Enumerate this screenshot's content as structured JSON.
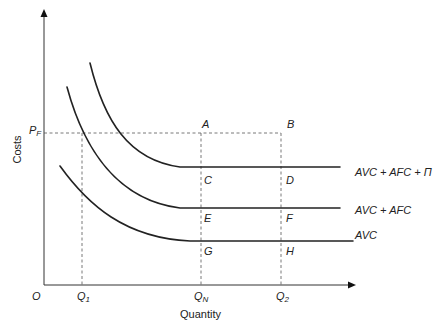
{
  "diagram": {
    "axes": {
      "y_title": "Costs",
      "x_title": "Quantity",
      "origin_label": "O"
    },
    "y_ticks": [
      {
        "main": "P",
        "sub": "F"
      }
    ],
    "x_ticks": [
      {
        "main": "Q",
        "sub": "1"
      },
      {
        "main": "Q",
        "sub": "N"
      },
      {
        "main": "Q",
        "sub": "2"
      }
    ],
    "points": {
      "A": "A",
      "B": "B",
      "C": "C",
      "D": "D",
      "E": "E",
      "F": "F",
      "G": "G",
      "H": "H"
    },
    "curves": [
      {
        "id": "avc_afc_profit",
        "label": "AVC + AFC + Π"
      },
      {
        "id": "avc_afc",
        "label": "AVC + AFC"
      },
      {
        "id": "avc",
        "label": "AVC"
      }
    ],
    "colors": {
      "line": "#222222",
      "dashed": "#555555"
    }
  }
}
